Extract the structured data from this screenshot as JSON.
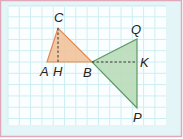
{
  "diagram": {
    "type": "geometry-figure",
    "colors": {
      "frame_border": "#e0a8b8",
      "frame_bg": "#e3f5f7",
      "grid_bg": "#fbfeff",
      "grid_line": "#cdeef2",
      "triangle_abc_fill": "#f2c29a",
      "triangle_abc_stroke": "#e08a55",
      "triangle_bqp_fill": "#b9dcb9",
      "triangle_bqp_stroke": "#5a9a63",
      "dashed_line": "#333333"
    },
    "points": {
      "A": {
        "label": "A",
        "x": 47,
        "y": 62
      },
      "H": {
        "label": "H",
        "x": 58,
        "y": 62
      },
      "B": {
        "label": "B",
        "x": 92,
        "y": 62
      },
      "C": {
        "label": "C",
        "x": 58,
        "y": 28
      },
      "Q": {
        "label": "Q",
        "x": 137,
        "y": 39
      },
      "K": {
        "label": "K",
        "x": 137,
        "y": 62
      },
      "P": {
        "label": "P",
        "x": 137,
        "y": 108
      }
    },
    "triangles": [
      {
        "name": "ABC",
        "vertices": [
          "A",
          "B",
          "C"
        ]
      },
      {
        "name": "BQP",
        "vertices": [
          "B",
          "Q",
          "P"
        ]
      }
    ],
    "dashed_segments": [
      {
        "name": "CH",
        "from": "C",
        "to": "H"
      },
      {
        "name": "BK",
        "from": "B",
        "to": "K"
      }
    ]
  }
}
